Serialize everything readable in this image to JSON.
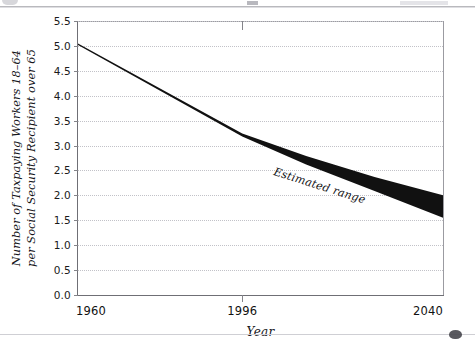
{
  "chart_data": {
    "type": "area",
    "title": "",
    "xlabel": "Year",
    "ylabel_lines": [
      "Number of Taxpaying Workers 18–64",
      "per Social Security Recipient over 65"
    ],
    "ylabel": "Number of Taxpaying Workers 18–64 per Social Security Recipient over 65",
    "xlim": [
      1960,
      2040
    ],
    "ylim": [
      0.0,
      5.5
    ],
    "grid": true,
    "legend_position": "inline-annotation",
    "x_tick_labels": [
      "1960",
      "1996",
      "2040"
    ],
    "x_tick_values": [
      1960,
      1996,
      2040
    ],
    "y_tick_labels": [
      "0.0",
      "0.5",
      "1.0",
      "1.5",
      "2.0",
      "2.5",
      "3.0",
      "3.5",
      "4.0",
      "4.5",
      "5.0",
      "5.5"
    ],
    "y_tick_values": [
      0.0,
      0.5,
      1.0,
      1.5,
      2.0,
      2.5,
      3.0,
      3.5,
      4.0,
      4.5,
      5.0,
      5.5
    ],
    "annotations": [
      {
        "text": "Estimated range",
        "x": 2003,
        "y": 2.6,
        "rotation": 17.5
      }
    ],
    "series": [
      {
        "name": "Upper bound",
        "x": [
          1960,
          1996,
          2010,
          2025,
          2040
        ],
        "values": [
          5.05,
          3.24,
          2.79,
          2.37,
          2.0
        ]
      },
      {
        "name": "Lower bound",
        "x": [
          1960,
          1996,
          2010,
          2025,
          2040
        ],
        "values": [
          5.02,
          3.18,
          2.62,
          2.09,
          1.55
        ]
      }
    ],
    "band_fill_color": "#111111",
    "grid_color": "#c2c2c8",
    "axis_color": "#6f6f75"
  },
  "axis_titles": {
    "x": "Year",
    "y_line1": "Number of Taxpaying Workers 18–64",
    "y_line2": "per Social Security Recipient over 65"
  },
  "annotation": {
    "estimated_range": "Estimated range"
  }
}
